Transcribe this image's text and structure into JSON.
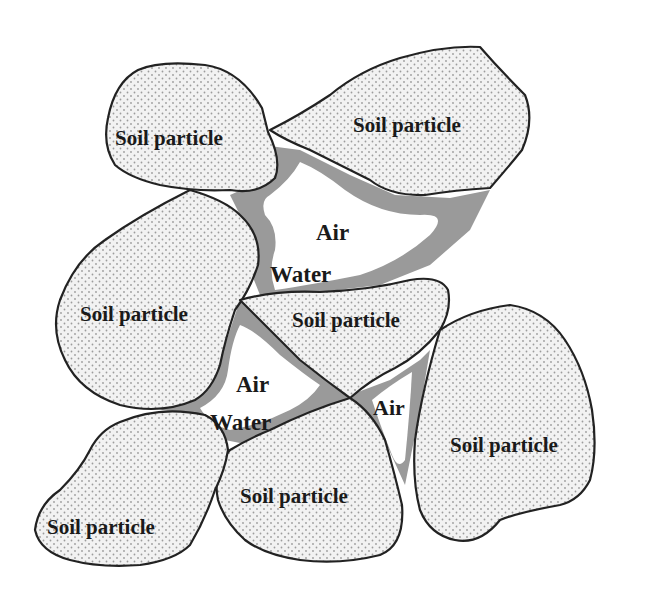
{
  "diagram": {
    "type": "soil three-phase schematic",
    "colors": {
      "soil_fill": "#f2f2f2",
      "soil_dots": "#9c9c9c",
      "water": "#9a9a9a",
      "air": "#ffffff",
      "outline": "#222222"
    },
    "particles": [
      {
        "id": "top-left",
        "label": "Soil particle"
      },
      {
        "id": "top-right",
        "label": "Soil particle"
      },
      {
        "id": "mid-left",
        "label": "Soil particle"
      },
      {
        "id": "center",
        "label": "Soil particle"
      },
      {
        "id": "right",
        "label": "Soil particle"
      },
      {
        "id": "bottom-center",
        "label": "Soil particle"
      },
      {
        "id": "bottom-left",
        "label": "Soil particle"
      }
    ],
    "pores": [
      {
        "id": "upper-pore",
        "air_label": "Air",
        "water_label": "Water"
      },
      {
        "id": "middle-pore",
        "air_label": "Air",
        "water_label": "Water"
      },
      {
        "id": "small-pore",
        "air_label": "Air"
      }
    ]
  }
}
